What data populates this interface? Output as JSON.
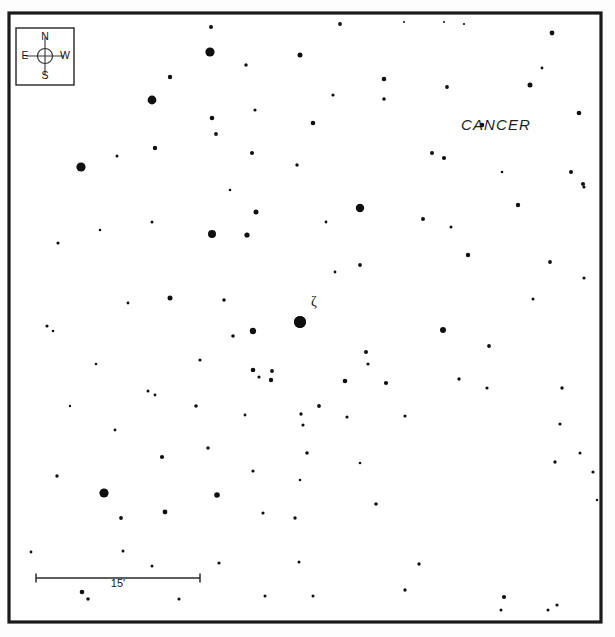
{
  "chart_data": {
    "type": "scatter",
    "title": "",
    "subtitle": "",
    "xlabel": "",
    "ylabel": "",
    "grid": false,
    "legend_position": "none",
    "xlim": [
      9,
      601
    ],
    "ylim": [
      13,
      622
    ],
    "constellation_label": "CANCER",
    "named_star_label": "ζ",
    "scale_bar_label": "15'",
    "scale_bar_length_px": 164,
    "compass": {
      "north": "N",
      "south": "S",
      "east": "E",
      "west": "W"
    },
    "colors": {
      "star": "#101010",
      "frame": "#1a1a1a",
      "background": "#ffffff",
      "text": "#141414"
    },
    "star_count": 121,
    "series": [
      {
        "name": "stars",
        "points": [
          {
            "x": 211,
            "y": 27,
            "r": 2.0
          },
          {
            "x": 340,
            "y": 24,
            "r": 1.9
          },
          {
            "x": 552,
            "y": 33,
            "r": 2.4
          },
          {
            "x": 464,
            "y": 24,
            "r": 1.1
          },
          {
            "x": 210,
            "y": 52,
            "r": 4.6
          },
          {
            "x": 300,
            "y": 55,
            "r": 2.5
          },
          {
            "x": 444,
            "y": 22,
            "r": 1.0
          },
          {
            "x": 542,
            "y": 68,
            "r": 1.4
          },
          {
            "x": 170,
            "y": 77,
            "r": 2.2
          },
          {
            "x": 246,
            "y": 65,
            "r": 1.7
          },
          {
            "x": 384,
            "y": 79,
            "r": 2.3
          },
          {
            "x": 404,
            "y": 22,
            "r": 1.0
          },
          {
            "x": 530,
            "y": 85,
            "r": 2.5
          },
          {
            "x": 447,
            "y": 87,
            "r": 1.9
          },
          {
            "x": 152,
            "y": 100,
            "r": 4.4
          },
          {
            "x": 212,
            "y": 118,
            "r": 2.3
          },
          {
            "x": 313,
            "y": 123,
            "r": 2.3
          },
          {
            "x": 384,
            "y": 99,
            "r": 1.8
          },
          {
            "x": 482,
            "y": 125,
            "r": 2.3
          },
          {
            "x": 579,
            "y": 113,
            "r": 2.3
          },
          {
            "x": 216,
            "y": 134,
            "r": 1.9
          },
          {
            "x": 333,
            "y": 95,
            "r": 1.6
          },
          {
            "x": 255,
            "y": 110,
            "r": 1.6
          },
          {
            "x": 155,
            "y": 148,
            "r": 2.2
          },
          {
            "x": 432,
            "y": 153,
            "r": 2.0
          },
          {
            "x": 81,
            "y": 167,
            "r": 4.6
          },
          {
            "x": 252,
            "y": 153,
            "r": 2.0
          },
          {
            "x": 297,
            "y": 165,
            "r": 1.7
          },
          {
            "x": 571,
            "y": 172,
            "r": 2.0
          },
          {
            "x": 583,
            "y": 184,
            "r": 2.1
          },
          {
            "x": 117,
            "y": 156,
            "r": 1.5
          },
          {
            "x": 444,
            "y": 158,
            "r": 2.1
          },
          {
            "x": 360,
            "y": 208,
            "r": 4.2
          },
          {
            "x": 256,
            "y": 212,
            "r": 2.5
          },
          {
            "x": 212,
            "y": 234,
            "r": 4.0
          },
          {
            "x": 247,
            "y": 235,
            "r": 2.6
          },
          {
            "x": 152,
            "y": 222,
            "r": 1.5
          },
          {
            "x": 423,
            "y": 219,
            "r": 2.0
          },
          {
            "x": 451,
            "y": 227,
            "r": 1.5
          },
          {
            "x": 518,
            "y": 205,
            "r": 2.2
          },
          {
            "x": 584,
            "y": 187,
            "r": 1.6
          },
          {
            "x": 58,
            "y": 243,
            "r": 1.6
          },
          {
            "x": 326,
            "y": 222,
            "r": 1.4
          },
          {
            "x": 360,
            "y": 265,
            "r": 1.9
          },
          {
            "x": 468,
            "y": 255,
            "r": 2.2
          },
          {
            "x": 550,
            "y": 262,
            "r": 1.9
          },
          {
            "x": 100,
            "y": 230,
            "r": 1.3
          },
          {
            "x": 170,
            "y": 298,
            "r": 2.5
          },
          {
            "x": 128,
            "y": 303,
            "r": 1.4
          },
          {
            "x": 224,
            "y": 300,
            "r": 1.8
          },
          {
            "x": 253,
            "y": 331,
            "r": 3.2
          },
          {
            "x": 233,
            "y": 336,
            "r": 1.8
          },
          {
            "x": 300,
            "y": 322,
            "r": 6.0
          },
          {
            "x": 335,
            "y": 272,
            "r": 1.4
          },
          {
            "x": 443,
            "y": 330,
            "r": 3.0
          },
          {
            "x": 366,
            "y": 352,
            "r": 2.0
          },
          {
            "x": 533,
            "y": 299,
            "r": 1.5
          },
          {
            "x": 584,
            "y": 278,
            "r": 1.6
          },
          {
            "x": 47,
            "y": 326,
            "r": 1.6
          },
          {
            "x": 53,
            "y": 331,
            "r": 1.3
          },
          {
            "x": 253,
            "y": 370,
            "r": 2.3
          },
          {
            "x": 259,
            "y": 377,
            "r": 1.6
          },
          {
            "x": 272,
            "y": 371,
            "r": 1.9
          },
          {
            "x": 271,
            "y": 380,
            "r": 2.2
          },
          {
            "x": 148,
            "y": 391,
            "r": 1.5
          },
          {
            "x": 155,
            "y": 395,
            "r": 1.4
          },
          {
            "x": 196,
            "y": 406,
            "r": 1.8
          },
          {
            "x": 245,
            "y": 415,
            "r": 1.4
          },
          {
            "x": 345,
            "y": 381,
            "r": 2.3
          },
          {
            "x": 368,
            "y": 364,
            "r": 1.6
          },
          {
            "x": 386,
            "y": 383,
            "r": 2.1
          },
          {
            "x": 459,
            "y": 379,
            "r": 1.7
          },
          {
            "x": 347,
            "y": 417,
            "r": 1.6
          },
          {
            "x": 405,
            "y": 416,
            "r": 1.6
          },
          {
            "x": 487,
            "y": 388,
            "r": 1.6
          },
          {
            "x": 562,
            "y": 388,
            "r": 1.7
          },
          {
            "x": 319,
            "y": 406,
            "r": 1.9
          },
          {
            "x": 200,
            "y": 360,
            "r": 1.6
          },
          {
            "x": 115,
            "y": 430,
            "r": 1.4
          },
          {
            "x": 208,
            "y": 448,
            "r": 1.7
          },
          {
            "x": 301,
            "y": 414,
            "r": 1.7
          },
          {
            "x": 303,
            "y": 425,
            "r": 1.6
          },
          {
            "x": 560,
            "y": 424,
            "r": 1.6
          },
          {
            "x": 555,
            "y": 462,
            "r": 1.7
          },
          {
            "x": 162,
            "y": 457,
            "r": 2.1
          },
          {
            "x": 253,
            "y": 471,
            "r": 1.6
          },
          {
            "x": 307,
            "y": 453,
            "r": 1.8
          },
          {
            "x": 57,
            "y": 476,
            "r": 1.7
          },
          {
            "x": 104,
            "y": 493,
            "r": 4.6
          },
          {
            "x": 217,
            "y": 495,
            "r": 2.8
          },
          {
            "x": 263,
            "y": 513,
            "r": 1.6
          },
          {
            "x": 121,
            "y": 518,
            "r": 1.9
          },
          {
            "x": 123,
            "y": 551,
            "r": 1.5
          },
          {
            "x": 165,
            "y": 512,
            "r": 2.4
          },
          {
            "x": 295,
            "y": 518,
            "r": 1.7
          },
          {
            "x": 376,
            "y": 504,
            "r": 1.8
          },
          {
            "x": 31,
            "y": 552,
            "r": 1.4
          },
          {
            "x": 419,
            "y": 564,
            "r": 1.7
          },
          {
            "x": 152,
            "y": 566,
            "r": 1.5
          },
          {
            "x": 219,
            "y": 563,
            "r": 1.6
          },
          {
            "x": 299,
            "y": 562,
            "r": 1.5
          },
          {
            "x": 82,
            "y": 592,
            "r": 2.3
          },
          {
            "x": 88,
            "y": 599,
            "r": 1.8
          },
          {
            "x": 179,
            "y": 599,
            "r": 1.6
          },
          {
            "x": 265,
            "y": 596,
            "r": 1.5
          },
          {
            "x": 313,
            "y": 596,
            "r": 1.5
          },
          {
            "x": 405,
            "y": 590,
            "r": 1.7
          },
          {
            "x": 504,
            "y": 597,
            "r": 2.1
          },
          {
            "x": 501,
            "y": 610,
            "r": 1.5
          },
          {
            "x": 548,
            "y": 610,
            "r": 1.5
          },
          {
            "x": 557,
            "y": 605,
            "r": 1.6
          },
          {
            "x": 593,
            "y": 472,
            "r": 1.6
          },
          {
            "x": 597,
            "y": 500,
            "r": 1.2
          },
          {
            "x": 360,
            "y": 463,
            "r": 1.3
          },
          {
            "x": 489,
            "y": 346,
            "r": 1.9
          },
          {
            "x": 580,
            "y": 453,
            "r": 1.5
          },
          {
            "x": 96,
            "y": 364,
            "r": 1.3
          },
          {
            "x": 70,
            "y": 406,
            "r": 1.2
          },
          {
            "x": 230,
            "y": 190,
            "r": 1.3
          },
          {
            "x": 300,
            "y": 480,
            "r": 1.3
          },
          {
            "x": 502,
            "y": 172,
            "r": 1.3
          }
        ]
      }
    ],
    "special_stars": [
      {
        "name": "zeta-cancri",
        "label": "ζ",
        "x": 300,
        "y": 322,
        "r": 6.0,
        "label_x": 314,
        "label_y": 303
      }
    ],
    "frame": {
      "x": 9,
      "y": 13,
      "width": 592,
      "height": 609
    },
    "compass_box": {
      "x": 16,
      "y": 28,
      "width": 58,
      "height": 57,
      "cx": 45,
      "cy": 56,
      "circle_r": 7.5,
      "arm": 19
    },
    "scale_bar": {
      "x1": 36,
      "x2": 200,
      "y": 578,
      "tick_height": 9,
      "label_x": 118,
      "label_y": 584
    }
  },
  "compass": {
    "north": "N",
    "south": "S",
    "east": "E",
    "west": "W"
  },
  "labels": {
    "constellation": "CANCER",
    "zeta": "ζ",
    "scale": "15'"
  }
}
